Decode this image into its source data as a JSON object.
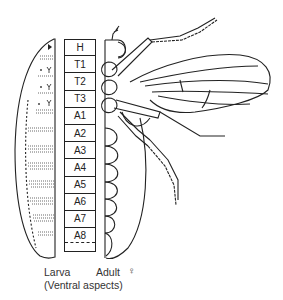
{
  "figure": {
    "segments": [
      "H",
      "T1",
      "T2",
      "T3",
      "A1",
      "A2",
      "A3",
      "A4",
      "A5",
      "A6",
      "A7",
      "A8"
    ],
    "labels": {
      "larva": "Larva",
      "adult": "Adult",
      "female_symbol": "♀",
      "caption": "(Ventral aspects)"
    },
    "colors": {
      "ink": "#222222",
      "background": "#ffffff"
    }
  }
}
